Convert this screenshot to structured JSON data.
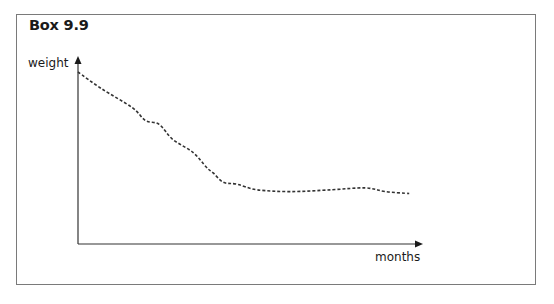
{
  "box": {
    "title": "Box 9.9"
  },
  "axes": {
    "y_label": "weight",
    "x_label": "months"
  },
  "colors": {
    "border": "#7a7a7a",
    "axis": "#333333",
    "curve": "#333333",
    "text": "#1a1a1a"
  },
  "chart_data": {
    "type": "line",
    "title": "Box 9.9",
    "xlabel": "months",
    "ylabel": "weight",
    "grid": false,
    "legend": null,
    "line_style": "dashed",
    "note": "Qualitative sketch without tick marks; values are relative positions (x: 0-100 along months axis, y: 0-100 along weight axis).",
    "xlim": [
      0,
      100
    ],
    "ylim": [
      0,
      100
    ],
    "series": [
      {
        "name": "weight",
        "x": [
          0,
          7,
          16,
          20,
          24,
          28,
          34,
          38,
          40,
          43,
          47,
          53,
          63,
          75,
          85,
          91,
          98
        ],
        "y": [
          92,
          83,
          73,
          66,
          64,
          56,
          49,
          41,
          38,
          33,
          32,
          29,
          28,
          29,
          30,
          28,
          27
        ]
      }
    ]
  }
}
